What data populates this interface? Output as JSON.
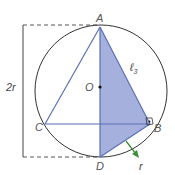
{
  "diagram": {
    "colors": {
      "circle": "#333333",
      "triangle_edges": "#5b6fb8",
      "shaded_fill": "#a6b0dc",
      "dash": "#444444",
      "arrow": "#3f8f3a",
      "center_dot": "#111111"
    },
    "points": {
      "A": {
        "label": "A",
        "x": 100,
        "y": 27
      },
      "B": {
        "label": "B",
        "x": 150,
        "y": 124
      },
      "C": {
        "label": "C",
        "x": 45,
        "y": 124
      },
      "D": {
        "label": "D",
        "x": 100,
        "y": 157
      },
      "O": {
        "label": "O",
        "x": 100,
        "y": 87
      }
    },
    "labels": {
      "diameter": "2r",
      "side": "ℓ",
      "side_subscript": "3",
      "segment_bd": "r"
    }
  }
}
